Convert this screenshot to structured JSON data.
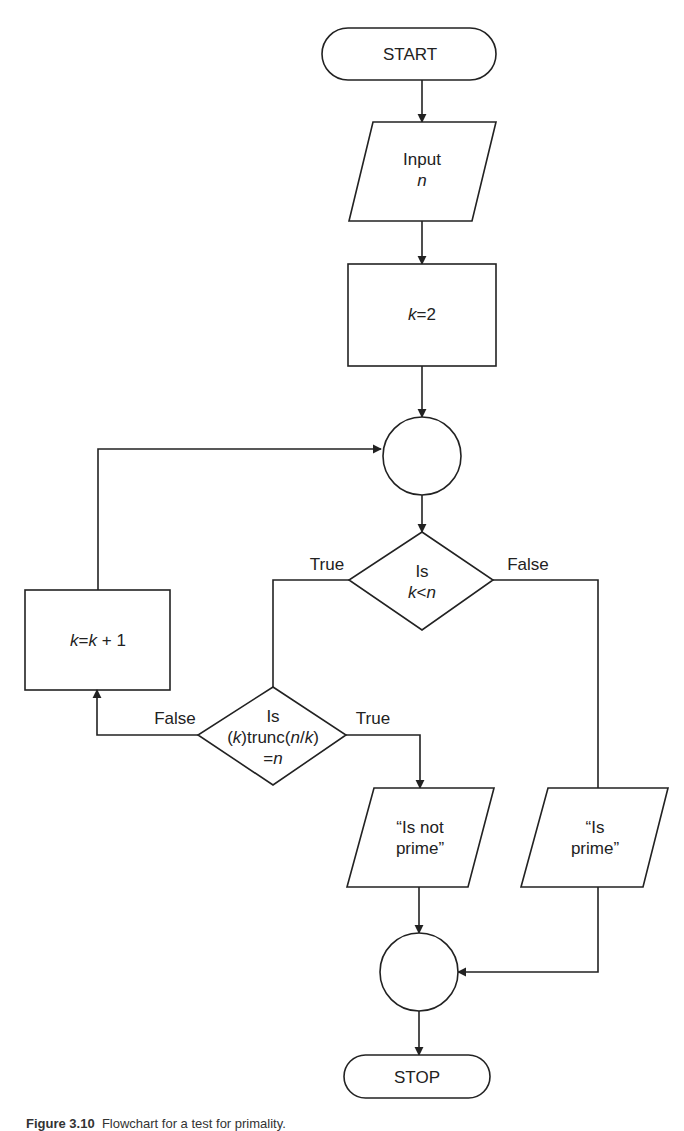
{
  "diagram": {
    "type": "flowchart",
    "nodes": [
      {
        "id": "start",
        "shape": "terminal",
        "text": "START"
      },
      {
        "id": "input",
        "shape": "parallelogram",
        "line1": "Input",
        "line2": "n"
      },
      {
        "id": "init",
        "shape": "rectangle",
        "var": "k",
        "op": "=",
        "val": "2"
      },
      {
        "id": "join1",
        "shape": "connector-circle",
        "text": ""
      },
      {
        "id": "dec1",
        "shape": "diamond",
        "line1": "Is",
        "var1": "k",
        "op": "<",
        "var2": "n"
      },
      {
        "id": "incr",
        "shape": "rectangle",
        "text_a": "k",
        "text_b": "=",
        "text_c": "k",
        "text_d": "+ 1"
      },
      {
        "id": "dec2",
        "shape": "diamond",
        "line1": "Is",
        "l2_a": "(",
        "l2_b": "k",
        "l2_c": ")trunc(",
        "l2_d": "n",
        "l2_e": "/",
        "l2_f": "k",
        "l2_g": ")",
        "l3_a": "=",
        "l3_b": "n"
      },
      {
        "id": "out_not",
        "shape": "parallelogram",
        "line1": "“Is not",
        "line2": "prime”"
      },
      {
        "id": "out_prime",
        "shape": "parallelogram",
        "line1": "“Is",
        "line2": "prime”"
      },
      {
        "id": "join2",
        "shape": "connector-circle",
        "text": ""
      },
      {
        "id": "stop",
        "shape": "terminal",
        "text": "STOP"
      }
    ],
    "edge_labels": {
      "dec1_true": "True",
      "dec1_false": "False",
      "dec2_false": "False",
      "dec2_true": "True"
    },
    "edges": [
      {
        "from": "start",
        "to": "input"
      },
      {
        "from": "input",
        "to": "init"
      },
      {
        "from": "init",
        "to": "join1"
      },
      {
        "from": "join1",
        "to": "dec1"
      },
      {
        "from": "dec1",
        "to": "dec2",
        "label": "True"
      },
      {
        "from": "dec1",
        "to": "out_prime",
        "label": "False"
      },
      {
        "from": "dec2",
        "to": "incr",
        "label": "False"
      },
      {
        "from": "dec2",
        "to": "out_not",
        "label": "True"
      },
      {
        "from": "incr",
        "to": "join1"
      },
      {
        "from": "out_not",
        "to": "join2"
      },
      {
        "from": "out_prime",
        "to": "join2"
      },
      {
        "from": "join2",
        "to": "stop"
      }
    ]
  },
  "caption": {
    "figure": "Figure 3.10",
    "text": "Flowchart for a test for primality."
  }
}
